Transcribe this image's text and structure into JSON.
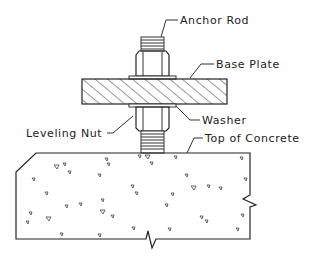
{
  "diagram": {
    "labels": {
      "anchor_rod": "Anchor Rod",
      "base_plate": "Base Plate",
      "washer": "Washer",
      "leveling_nut": "Leveling Nut",
      "top_of_concrete": "Top of Concrete"
    },
    "colors": {
      "line": "#333333",
      "background": "#ffffff"
    }
  }
}
